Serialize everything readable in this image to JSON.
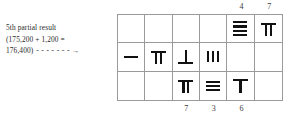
{
  "annotation": {
    "line1": "5th partial result",
    "line2": "(175,200 + 1,200 =",
    "line3": "176,400)",
    "dashes": "- - - - - - -",
    "arrow": "→"
  },
  "grid": {
    "columns": 6,
    "rows": 3,
    "top_labels": [
      {
        "column": 5,
        "value": "4"
      },
      {
        "column": 6,
        "value": "7"
      }
    ],
    "bottom_labels": [
      {
        "column": 3,
        "value": "7"
      },
      {
        "column": 4,
        "value": "3"
      },
      {
        "column": 5,
        "value": "6"
      }
    ],
    "cells": [
      {
        "row": 1,
        "column": 1,
        "numeral": "",
        "value": null,
        "form": ""
      },
      {
        "row": 1,
        "column": 2,
        "numeral": "",
        "value": null,
        "form": ""
      },
      {
        "row": 1,
        "column": 3,
        "numeral": "",
        "value": null,
        "form": ""
      },
      {
        "row": 1,
        "column": 4,
        "numeral": "",
        "value": null,
        "form": ""
      },
      {
        "row": 1,
        "column": 5,
        "numeral": "≡≡",
        "value": 4,
        "form": "horizontal"
      },
      {
        "row": 1,
        "column": 6,
        "numeral": "Π",
        "value": 7,
        "form": "vertical"
      },
      {
        "row": 2,
        "column": 1,
        "numeral": "—",
        "value": 1,
        "form": "horizontal"
      },
      {
        "row": 2,
        "column": 2,
        "numeral": "Π",
        "value": 7,
        "form": "vertical"
      },
      {
        "row": 2,
        "column": 3,
        "numeral": "⊥",
        "value": 6,
        "form": "vertical"
      },
      {
        "row": 2,
        "column": 4,
        "numeral": "|||",
        "value": 3,
        "form": "vertical"
      },
      {
        "row": 2,
        "column": 5,
        "numeral": "",
        "value": null,
        "form": ""
      },
      {
        "row": 2,
        "column": 6,
        "numeral": "",
        "value": null,
        "form": ""
      },
      {
        "row": 3,
        "column": 1,
        "numeral": "",
        "value": null,
        "form": ""
      },
      {
        "row": 3,
        "column": 2,
        "numeral": "",
        "value": null,
        "form": ""
      },
      {
        "row": 3,
        "column": 3,
        "numeral": "Π",
        "value": 7,
        "form": "vertical"
      },
      {
        "row": 3,
        "column": 4,
        "numeral": "≡",
        "value": 3,
        "form": "horizontal"
      },
      {
        "row": 3,
        "column": 5,
        "numeral": "⊤",
        "value": 6,
        "form": "vertical"
      },
      {
        "row": 3,
        "column": 6,
        "numeral": "",
        "value": null,
        "form": ""
      }
    ]
  },
  "colors": {
    "rod": "#111111",
    "grid_line": "#9a9a9a",
    "text": "#2b2b2b",
    "background": "#ffffff"
  }
}
